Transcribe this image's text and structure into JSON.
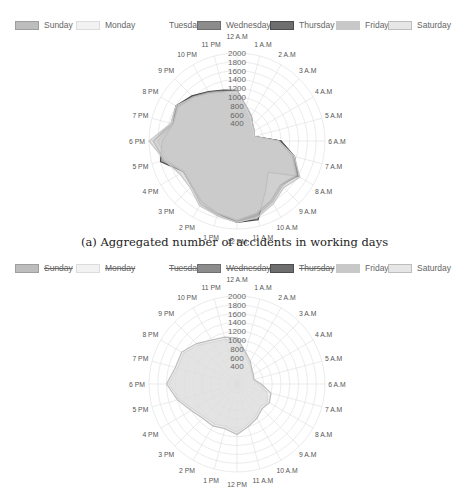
{
  "legend_top": {
    "items": [
      {
        "label": "Sunday",
        "fill": "#bdbdbd",
        "stroke": "#9e9e9e",
        "hidden": false
      },
      {
        "label": "Monday",
        "fill": "#f2f2f2",
        "stroke": "#dcdcdc",
        "hidden": false
      },
      {
        "label": "Tuesday",
        "fill": "#ffffff",
        "stroke": "#ffffff",
        "hidden": false
      },
      {
        "label": "Wednesday",
        "fill": "#8c8c8c",
        "stroke": "#6e6e6e",
        "hidden": false
      },
      {
        "label": "Thursday",
        "fill": "#6e6e6e",
        "stroke": "#4d4d4d",
        "hidden": false
      },
      {
        "label": "Friday",
        "fill": "#c8c8c8",
        "stroke": "#c8c8c8",
        "hidden": false
      },
      {
        "label": "Saturday",
        "fill": "#e6e6e6",
        "stroke": "#bdbdbd",
        "hidden": false
      }
    ]
  },
  "legend_bottom": {
    "items": [
      {
        "label": "Sunday",
        "fill": "#bdbdbd",
        "stroke": "#9e9e9e",
        "hidden": true
      },
      {
        "label": "Monday",
        "fill": "#f2f2f2",
        "stroke": "#dcdcdc",
        "hidden": true
      },
      {
        "label": "Tuesday",
        "fill": "#ffffff",
        "stroke": "#ffffff",
        "hidden": true
      },
      {
        "label": "Wednesday",
        "fill": "#8c8c8c",
        "stroke": "#6e6e6e",
        "hidden": true
      },
      {
        "label": "Thursday",
        "fill": "#6e6e6e",
        "stroke": "#4d4d4d",
        "hidden": true
      },
      {
        "label": "Friday",
        "fill": "#c8c8c8",
        "stroke": "#c8c8c8",
        "hidden": false
      },
      {
        "label": "Saturday",
        "fill": "#e6e6e6",
        "stroke": "#bdbdbd",
        "hidden": false
      }
    ]
  },
  "caption_a": "(a) Aggregated number of accidents in working days",
  "chart_data": [
    {
      "type": "radar",
      "title": "(a) Aggregated number of accidents in working days",
      "categories": [
        "12 A.M",
        "1 A.M",
        "2 A.M",
        "3 A.M",
        "4 A.M",
        "5 A.M",
        "6 A.M",
        "7 A.M",
        "8 A.M",
        "9 A.M",
        "10 A.M",
        "11 A.M",
        "12 PM",
        "1 PM",
        "2 PM",
        "3 PM",
        "4 PM",
        "5 PM",
        "6 PM",
        "7 PM",
        "8 PM",
        "9 PM",
        "10 PM",
        "11 PM"
      ],
      "radial_ticks": [
        200,
        400,
        600,
        800,
        1000,
        1200,
        1400,
        1600,
        1800,
        2000
      ],
      "rlim": [
        0,
        2000
      ],
      "grid": true,
      "legend_position": "top",
      "series": [
        {
          "name": "Sunday",
          "values": [
            1100,
            800,
            650,
            500,
            450,
            400,
            350,
            1250,
            1500,
            1350,
            1500,
            1700,
            1800,
            1700,
            1600,
            1400,
            1350,
            1700,
            1900,
            1550,
            1600,
            1400,
            1250,
            1150
          ]
        },
        {
          "name": "Monday",
          "values": [
            1050,
            750,
            600,
            480,
            430,
            380,
            1000,
            1300,
            1550,
            1450,
            1600,
            1750,
            1850,
            1750,
            1650,
            1450,
            1400,
            1650,
            1850,
            1500,
            1550,
            1350,
            1200,
            1100
          ]
        },
        {
          "name": "Tuesday",
          "values": [
            1050,
            760,
            600,
            480,
            430,
            380,
            1000,
            1300,
            1550,
            1450,
            1600,
            1750,
            1850,
            1750,
            1650,
            1450,
            1400,
            1650,
            1850,
            1500,
            1550,
            1350,
            1200,
            1100
          ]
        },
        {
          "name": "Wednesday",
          "values": [
            1100,
            780,
            620,
            490,
            440,
            390,
            1000,
            1350,
            1600,
            1400,
            1550,
            1700,
            1800,
            1700,
            1600,
            1450,
            1400,
            1650,
            1800,
            1500,
            1550,
            1400,
            1250,
            1150
          ]
        },
        {
          "name": "Thursday",
          "values": [
            1150,
            800,
            650,
            500,
            450,
            400,
            1000,
            1350,
            1600,
            1000,
            1300,
            1850,
            1850,
            1700,
            1600,
            1450,
            1400,
            1800,
            1700,
            1500,
            1600,
            1450,
            1300,
            1200
          ]
        },
        {
          "name": "Friday",
          "values": [
            1100,
            780,
            620,
            490,
            440,
            390,
            950,
            1350,
            1650,
            1500,
            1650,
            1800,
            1850,
            1750,
            1700,
            1500,
            1500,
            1700,
            2000,
            1550,
            1600,
            1400,
            1250,
            1150
          ]
        },
        {
          "name": "Saturday",
          "values": [
            1150,
            820,
            660,
            510,
            460,
            410,
            950,
            1300,
            1550,
            1400,
            1550,
            1700,
            1800,
            1700,
            1650,
            1450,
            1400,
            1700,
            1900,
            1500,
            1550,
            1400,
            1250,
            1150
          ]
        }
      ]
    },
    {
      "type": "radar",
      "title": "",
      "categories": [
        "12 A.M",
        "1 A.M",
        "2 A.M",
        "3 A.M",
        "4 A.M",
        "5 A.M",
        "6 A.M",
        "7 A.M",
        "8 A.M",
        "9 A.M",
        "10 A.M",
        "11 A.M",
        "12 PM",
        "1 PM",
        "2 PM",
        "3 PM",
        "4 PM",
        "5 PM",
        "6 PM",
        "7 PM",
        "8 PM",
        "9 PM",
        "10 PM",
        "11 PM"
      ],
      "radial_ticks": [
        200,
        400,
        600,
        800,
        1000,
        1200,
        1400,
        1600,
        1800,
        2000
      ],
      "rlim": [
        0,
        2000
      ],
      "grid": true,
      "legend_position": "top",
      "hidden_series": [
        "Sunday",
        "Monday",
        "Tuesday",
        "Wednesday",
        "Thursday"
      ],
      "series": [
        {
          "name": "Friday",
          "values": [
            1000,
            700,
            550,
            450,
            400,
            380,
            500,
            700,
            800,
            750,
            850,
            950,
            1100,
            1000,
            1050,
            1050,
            1150,
            1350,
            1550,
            1400,
            1400,
            1250,
            1100,
            1050
          ]
        },
        {
          "name": "Saturday",
          "values": [
            1050,
            750,
            600,
            480,
            430,
            400,
            550,
            800,
            850,
            800,
            900,
            1000,
            1150,
            1050,
            1100,
            1100,
            1200,
            1400,
            1600,
            1450,
            1450,
            1300,
            1150,
            1100
          ]
        }
      ]
    }
  ]
}
